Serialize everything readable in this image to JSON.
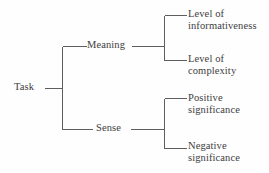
{
  "diagram": {
    "type": "tree-hierarchy",
    "orientation": "left-to-right",
    "root": {
      "label": "Task"
    },
    "branches": [
      {
        "label": "Meaning",
        "children": [
          {
            "line1": "Level of",
            "line2": "informativeness"
          },
          {
            "line1": "Level of",
            "line2": "complexity"
          }
        ]
      },
      {
        "label": "Sense",
        "children": [
          {
            "line1": "Positive",
            "line2": "significance"
          },
          {
            "line1": "Negative",
            "line2": "significance"
          }
        ]
      }
    ],
    "style": {
      "line_color": "#5e5e5e",
      "text_color": "#3d3d3d",
      "background": "#fefefe",
      "line_width": 1
    }
  }
}
